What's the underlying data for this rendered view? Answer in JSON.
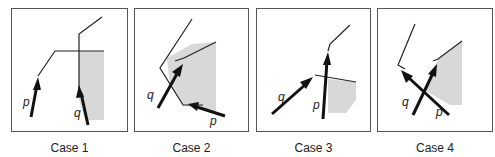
{
  "figure": {
    "cases": [
      {
        "caption": "Case 1",
        "labels": {
          "p": "p",
          "q": "q"
        }
      },
      {
        "caption": "Case 2",
        "labels": {
          "p": "p",
          "q": "q"
        }
      },
      {
        "caption": "Case 3",
        "labels": {
          "p": "p",
          "q": "q"
        }
      },
      {
        "caption": "Case 4",
        "labels": {
          "p": "p",
          "q": "q"
        }
      }
    ],
    "colors": {
      "edge": "#222222",
      "shade": "#d8d8d8",
      "border": "#555555"
    }
  }
}
